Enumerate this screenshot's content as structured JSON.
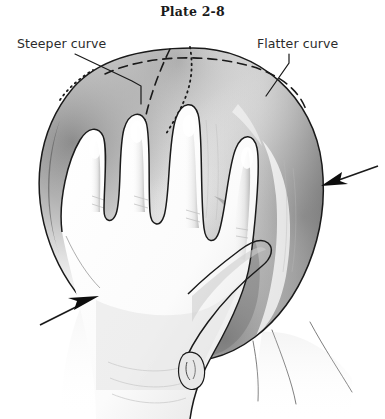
{
  "figure": {
    "title": "Plate 2-8",
    "background_color": "#ffffff",
    "ink_color": "#1a1a1a",
    "caption_font_style": "bold-serif"
  },
  "annotations": [
    {
      "id": "steeper-curve",
      "label": "Steeper curve",
      "position": "upper-left",
      "leader_line": "from label right edge down-right to the vertical dashed suture line on the left side of the cranium",
      "marker_style": "solid thin leader with short horizontal elbow"
    },
    {
      "id": "flatter-curve",
      "label": "Flatter curve",
      "position": "upper-right",
      "leader_line": "from label left edge down-left to the horizontal dashed curve on the right side of the cranium",
      "marker_style": "solid thin leader"
    }
  ],
  "arrows": [
    {
      "id": "right-pressure-arrow",
      "direction": "points left toward the occiput",
      "tip_x": 321,
      "tip_y": 186,
      "tail_x": 378,
      "tail_y": 166
    },
    {
      "id": "left-pressure-arrow",
      "direction": "points up-right toward the wrist and head",
      "tip_x": 99,
      "tip_y": 296,
      "tail_x": 40,
      "tail_y": 325
    }
  ],
  "drawing": {
    "subject": "infant head palpated by an examining hand",
    "elements": [
      {
        "name": "cranium-outline",
        "style": "solid contour, ovoid"
      },
      {
        "name": "dashed-horizontal-curve",
        "style": "dashed",
        "meaning": "flatter curve of the cranium"
      },
      {
        "name": "dashed-vertical-curve",
        "style": "dashed",
        "meaning": "steeper curve of the cranium"
      },
      {
        "name": "dotted-curve",
        "style": "dotted",
        "meaning": "reference suture line"
      },
      {
        "name": "hand-with-four-fingers",
        "style": "solid contour with graphite shading"
      },
      {
        "name": "thumb",
        "style": "solid contour"
      },
      {
        "name": "ear",
        "style": "small solid contour at inferior margin"
      },
      {
        "name": "neck-and-shoulder-lines",
        "style": "thin solid lines"
      }
    ],
    "shading": "soft graphite/pencil tonal shading, darkest along the left rim and lower-right quadrant of the cranium"
  },
  "colors": {
    "paper": "#ffffff",
    "line": "#1a1a1a",
    "label_text": "#2b2b2b",
    "shadow_mid": "#9a9a9a",
    "shadow_dark": "#5c5c5c",
    "shadow_light": "#d8d8d8"
  }
}
